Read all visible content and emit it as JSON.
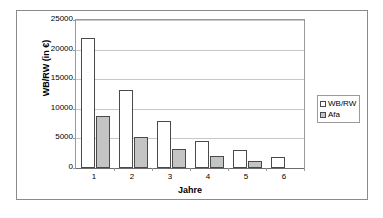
{
  "chart_data": {
    "type": "bar",
    "title": "",
    "xlabel": "Jahre",
    "ylabel": "WB/RW (in €)",
    "categories": [
      "1",
      "2",
      "3",
      "4",
      "5",
      "6"
    ],
    "series": [
      {
        "name": "WB/RW",
        "values": [
          22000,
          13200,
          8000,
          4600,
          3000,
          1900
        ],
        "color": "#ffffff"
      },
      {
        "name": "Afa",
        "values": [
          8800,
          5200,
          3200,
          2000,
          1200,
          0
        ],
        "color": "#c4c4c4"
      }
    ],
    "ylim": [
      0,
      25000
    ],
    "yticks": [
      0,
      5000,
      10000,
      15000,
      20000,
      25000
    ],
    "ytick_labels": [
      "0",
      "5000",
      "10000",
      "15000",
      "20000",
      "25000"
    ],
    "grid": true,
    "legend_position": "right"
  },
  "legend": {
    "entries": [
      {
        "label": "WB/RW"
      },
      {
        "label": "Afa"
      }
    ]
  }
}
